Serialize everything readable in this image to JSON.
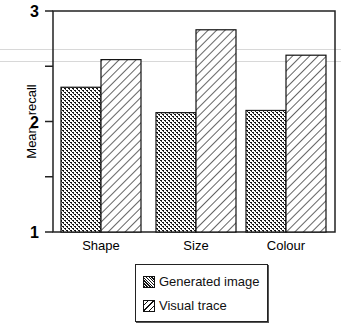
{
  "chart_data": {
    "type": "bar",
    "title": "",
    "xlabel": "",
    "ylabel": "Mean   recall",
    "ylim": [
      1,
      3
    ],
    "yticks": [
      1,
      1.5,
      2,
      2.5,
      3
    ],
    "ytick_labels": [
      "1",
      "",
      "2",
      "",
      "3"
    ],
    "categories": [
      "Shape",
      "Size",
      "Colour"
    ],
    "series": [
      {
        "name": "Generated image",
        "pattern": "stipple",
        "values": [
          2.31,
          2.08,
          2.1
        ]
      },
      {
        "name": "Visual trace",
        "pattern": "diagonal-hatch",
        "values": [
          2.56,
          2.83,
          2.6
        ]
      }
    ],
    "grid": false,
    "legend_position": "bottom-center"
  },
  "legend": {
    "items": [
      {
        "label": "Generated image"
      },
      {
        "label": "Visual trace"
      }
    ]
  }
}
